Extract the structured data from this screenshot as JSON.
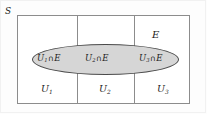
{
  "figure": {
    "kind": "venn-partition-diagram",
    "sample_space_label": "S",
    "event_label": "E",
    "set_operator": "∩",
    "colors": {
      "page_background": "#fdfdfd",
      "rectangle_border": "#8c8c8c",
      "rectangle_fill": "#ffffff",
      "ellipse_border": "#4a4a4a",
      "ellipse_fill": "#d6d6d6",
      "text": "#1b1b1b"
    },
    "partitions": [
      {
        "name": "U",
        "index": "1",
        "label": "U₁",
        "base": "U",
        "sub": "1"
      },
      {
        "name": "U",
        "index": "2",
        "label": "U₂",
        "base": "U",
        "sub": "2"
      },
      {
        "name": "U",
        "index": "3",
        "label": "U₃",
        "base": "U",
        "sub": "3"
      }
    ],
    "intersections": [
      {
        "label": "U₁ ∩ E",
        "base": "U",
        "sub": "1",
        "operator": "∩",
        "event": "E"
      },
      {
        "label": "U₂ ∩ E",
        "base": "U",
        "sub": "2",
        "operator": "∩",
        "event": "E"
      },
      {
        "label": "U₃ ∩ E",
        "base": "U",
        "sub": "3",
        "operator": "∩",
        "event": "E"
      }
    ]
  }
}
